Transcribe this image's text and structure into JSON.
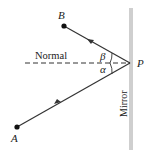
{
  "diagram": {
    "points": {
      "A": {
        "label": "A",
        "x": 17,
        "y": 127
      },
      "B": {
        "label": "B",
        "x": 64,
        "y": 26
      },
      "P": {
        "label": "P",
        "x": 130,
        "y": 63
      }
    },
    "labels": {
      "normal": "Normal",
      "mirror": "Mirror",
      "alpha": "α",
      "beta": "β"
    },
    "colors": {
      "line": "#333333",
      "mirror": "#cfcfcf",
      "text": "#222222"
    }
  }
}
